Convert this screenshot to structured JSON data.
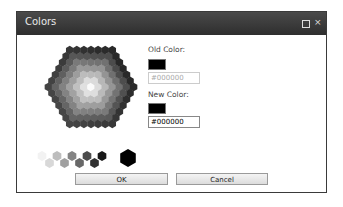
{
  "window": {
    "title": "Colors",
    "maximize_icon": "maximize-icon",
    "close_icon": "close-icon",
    "close_glyph": "×"
  },
  "picker": {
    "old_label": "Old Color:",
    "old_color": "#000000",
    "old_value": "#000000",
    "new_label": "New Color:",
    "new_color": "#000000",
    "new_value": "#000000"
  },
  "grays": [
    "#f2f2f2",
    "#d8d8d8",
    "#bdbdbd",
    "#a0a0a0",
    "#848484",
    "#686868",
    "#4c4c4c",
    "#303030",
    "#181818"
  ],
  "selected_gray": "#000000",
  "buttons": {
    "ok": "OK",
    "cancel": "Cancel"
  }
}
